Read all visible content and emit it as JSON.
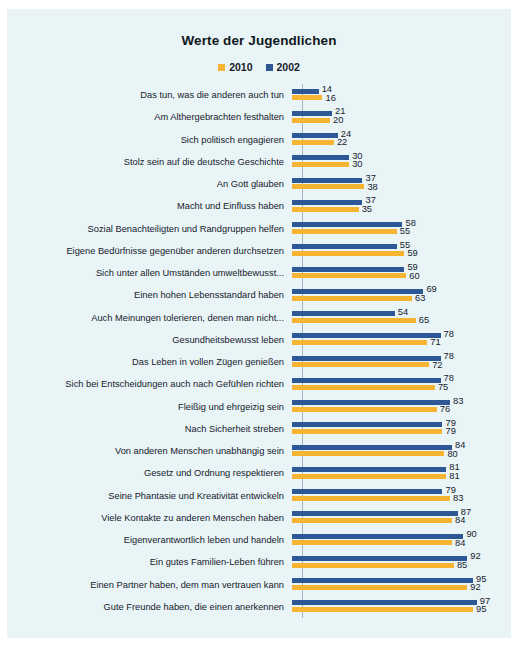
{
  "chart": {
    "title": "Werte der Jugendlichen"
  },
  "legend": [
    {
      "label": "2010",
      "color": "#f6b430"
    },
    {
      "label": "2002",
      "color": "#2d5795"
    }
  ],
  "chart_data": {
    "type": "bar",
    "orientation": "horizontal",
    "title": "Werte der Jugendlichen",
    "xlabel": "",
    "ylabel": "",
    "xlim": [
      0,
      100
    ],
    "grid": false,
    "legend_position": "top-center",
    "categories": [
      "Das tun, was die anderen auch tun",
      "Am Althergebrachten festhalten",
      "Sich politisch engagieren",
      "Stolz sein auf die deutsche Geschichte",
      "An Gott glauben",
      "Macht und Einfluss haben",
      "Sozial Benachteiligten und Randgruppen helfen",
      "Eigene Bedürfnisse gegenüber anderen durchsetzen",
      "Sich unter allen Umständen umweltbewusst...",
      "Einen hohen Lebensstandard haben",
      "Auch Meinungen tolerieren, denen man nicht...",
      "Gesundheitsbewusst leben",
      "Das Leben in vollen Zügen genießen",
      "Sich bei Entscheidungen auch nach Gefühlen richten",
      "Fleißig und ehrgeizig sein",
      "Nach Sicherheit streben",
      "Von anderen Menschen unabhängig sein",
      "Gesetz und Ordnung respektieren",
      "Seine Phantasie und Kreativität entwickeln",
      "Viele Kontakte zu anderen Menschen haben",
      "Eigenverantwortlich leben und handeln",
      "Ein gutes Familien-Leben führen",
      "Einen Partner haben, dem man vertrauen kann",
      "Gute Freunde haben, die einen anerkennen"
    ],
    "series": [
      {
        "name": "2002",
        "color": "#2d5795",
        "values": [
          14,
          21,
          24,
          30,
          37,
          37,
          58,
          55,
          59,
          69,
          54,
          78,
          78,
          78,
          83,
          79,
          84,
          81,
          79,
          87,
          90,
          92,
          95,
          97
        ]
      },
      {
        "name": "2010",
        "color": "#f6b430",
        "values": [
          16,
          20,
          22,
          30,
          38,
          35,
          55,
          59,
          60,
          63,
          65,
          71,
          72,
          75,
          76,
          79,
          80,
          81,
          83,
          84,
          84,
          85,
          92,
          95
        ]
      }
    ]
  }
}
